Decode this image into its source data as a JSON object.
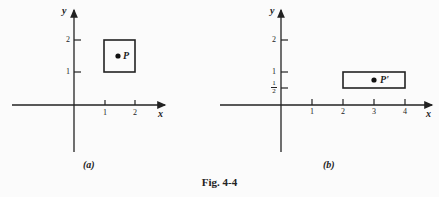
{
  "figure": {
    "caption": "Fig. 4-4",
    "panels": [
      {
        "label": "(a)",
        "x_axis_label": "x",
        "y_axis_label": "y",
        "x_ticks": [
          "1",
          "2"
        ],
        "y_ticks": [
          "1",
          "2"
        ],
        "rectangle": {
          "x_min": 1,
          "x_max": 2,
          "y_min": 1,
          "y_max": 2
        },
        "point": {
          "label": "P",
          "x": 1.5,
          "y": 1.5
        }
      },
      {
        "label": "(b)",
        "x_axis_label": "x",
        "y_axis_label": "y",
        "x_ticks": [
          "1",
          "2",
          "3",
          "4"
        ],
        "y_ticks": [
          "1/2",
          "1",
          "2"
        ],
        "rectangle": {
          "x_min": 2,
          "x_max": 4,
          "y_min": 0.5,
          "y_max": 1
        },
        "point": {
          "label": "P'",
          "x": 3,
          "y": 0.75
        }
      }
    ]
  }
}
